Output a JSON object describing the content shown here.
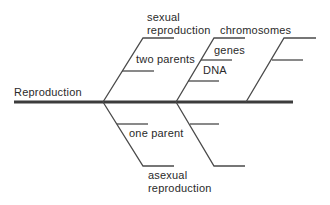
{
  "diagram": {
    "type": "fishbone",
    "spine_label": "Reproduction",
    "colors": {
      "line": "#4a4a4a",
      "spine": "#3c3c3c",
      "text": "#2a2a2a"
    },
    "branches": {
      "top_1": {
        "label_line1": "sexual",
        "label_line2": "reproduction",
        "sub": [
          "two parents"
        ]
      },
      "top_2": {
        "label": "chromosomes",
        "sub": [
          "genes",
          "DNA"
        ]
      },
      "top_3": {
        "label": "",
        "sub": [
          ""
        ]
      },
      "bottom_1": {
        "label_line1": "asexual",
        "label_line2": "reproduction",
        "sub": [
          "one parent"
        ]
      },
      "bottom_2": {
        "label": "",
        "sub": [
          ""
        ]
      }
    }
  }
}
